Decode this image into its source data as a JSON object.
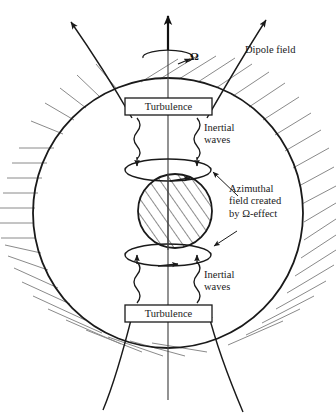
{
  "figure": {
    "type": "schematic-diagram",
    "background_color": "#ffffff",
    "line_color": "#1a1a1a",
    "hatch_color": "#8a8a8a"
  },
  "labels": {
    "dipole_field": "Dipole field",
    "omega": "Ω",
    "turbulence_top": "Turbulence",
    "turbulence_bottom": "Turbulence",
    "inertial_waves_top": "Inertial\nwaves",
    "inertial_waves_bottom": "Inertial\nwaves",
    "azimuthal_field": "Azimuthal\nfield created\nby Ω-effect"
  },
  "geometry": {
    "outer_sphere": {
      "cx": 168,
      "cy": 213,
      "r": 135
    },
    "inner_core": {
      "cx": 175,
      "cy": 211,
      "rx": 37,
      "ry": 37
    },
    "rotation_axis": {
      "x": 168,
      "y_top": 14,
      "y_bottom": 400
    },
    "turbulence_box_top": {
      "x": 125,
      "y": 98,
      "w": 87,
      "h": 17
    },
    "turbulence_box_bottom": {
      "x": 125,
      "y": 305,
      "w": 87,
      "h": 17
    },
    "azimuthal_ellipse_top": {
      "cx": 168,
      "cy": 170,
      "rx": 43,
      "ry": 11
    },
    "azimuthal_ellipse_bottom": {
      "cx": 168,
      "cy": 255,
      "rx": 43,
      "ry": 11
    },
    "rotation_ellipse": {
      "cx": 168,
      "cy": 58,
      "rx": 25,
      "ry": 7
    }
  },
  "elements": {
    "dipole_field_lines": 4,
    "inertial_wave_arrows": 4,
    "hatching": "radial-exterior-hatch",
    "inner_core_fill": "diagonal-hatch"
  }
}
